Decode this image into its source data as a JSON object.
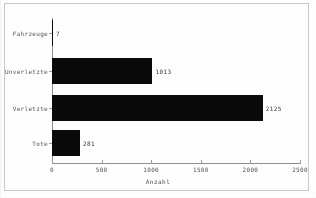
{
  "chart_data": {
    "type": "bar",
    "orientation": "horizontal",
    "title": "",
    "xlabel": "Anzahl",
    "ylabel": "",
    "categories": [
      "Tote",
      "Verletzte",
      "Unverletzte",
      "Fahrzeuge"
    ],
    "values": [
      281,
      2125,
      1013,
      7
    ],
    "value_labels": [
      "281",
      "2125",
      "1013",
      "7"
    ],
    "xlim": [
      0,
      2500
    ],
    "xticks": [
      0,
      500,
      1000,
      1500,
      2000,
      2500
    ],
    "xtick_labels": [
      "0",
      "500",
      "1000",
      "1500",
      "2000",
      "2500"
    ],
    "grid": false,
    "legend": "none",
    "bar_color": "#0a0a0a",
    "axis_color": "#8e8e8e"
  },
  "figure": {
    "background": "#fdfdfd",
    "frame_color": "#c9c9c9"
  }
}
